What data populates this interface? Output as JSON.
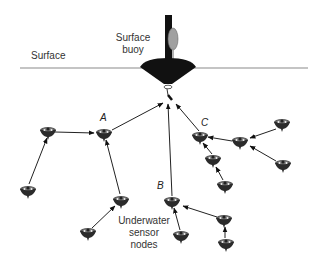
{
  "labels": {
    "surface": "Surface",
    "buoy_line1": "Surface",
    "buoy_line2": "buoy",
    "sensor_line1": "Underwater",
    "sensor_line2": "sensor",
    "sensor_line3": "nodes",
    "cluster_a": "A",
    "cluster_b": "B",
    "cluster_c": "C"
  },
  "colors": {
    "line": "#222222",
    "surface_line": "#888888",
    "buoy_body": "#111111",
    "buoy_float": "#9a9a9a",
    "node": "#333333",
    "text": "#333333"
  },
  "surface_line": {
    "x1": 20,
    "x2": 308,
    "y": 68
  },
  "buoy": {
    "x": 168,
    "y": 68
  },
  "nodes": [
    {
      "id": "n1",
      "x": 48,
      "y": 132
    },
    {
      "id": "n2",
      "x": 104,
      "y": 134,
      "cluster": "A"
    },
    {
      "id": "n3",
      "x": 28,
      "y": 191
    },
    {
      "id": "n4",
      "x": 121,
      "y": 201
    },
    {
      "id": "n5",
      "x": 88,
      "y": 233
    },
    {
      "id": "n6",
      "x": 172,
      "y": 202,
      "cluster": "B"
    },
    {
      "id": "n7",
      "x": 181,
      "y": 236
    },
    {
      "id": "n8",
      "x": 224,
      "y": 220
    },
    {
      "id": "n9",
      "x": 226,
      "y": 244
    },
    {
      "id": "n10",
      "x": 200,
      "y": 137,
      "cluster": "C"
    },
    {
      "id": "n11",
      "x": 240,
      "y": 142
    },
    {
      "id": "n12",
      "x": 282,
      "y": 124
    },
    {
      "id": "n13",
      "x": 213,
      "y": 160
    },
    {
      "id": "n14",
      "x": 283,
      "y": 165
    },
    {
      "id": "n15",
      "x": 225,
      "y": 186
    }
  ],
  "edges": [
    {
      "from": "n1",
      "to": "n2"
    },
    {
      "from": "n3",
      "to": "n1"
    },
    {
      "from": "n4",
      "to": "n2"
    },
    {
      "from": "n5",
      "to": "n4"
    },
    {
      "from": "n2",
      "to": "buoy"
    },
    {
      "from": "n6",
      "to": "buoy"
    },
    {
      "from": "n10",
      "to": "buoy"
    },
    {
      "from": "n11",
      "to": "n10"
    },
    {
      "from": "n12",
      "to": "n11"
    },
    {
      "from": "n14",
      "to": "n11"
    },
    {
      "from": "n13",
      "to": "n10"
    },
    {
      "from": "n15",
      "to": "n13"
    },
    {
      "from": "n7",
      "to": "n6"
    },
    {
      "from": "n8",
      "to": "n6"
    },
    {
      "from": "n9",
      "to": "n8"
    }
  ]
}
